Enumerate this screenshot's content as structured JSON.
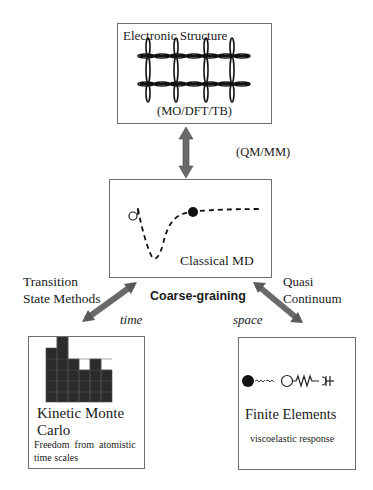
{
  "diagram": {
    "nodes": {
      "electronic_structure": {
        "title": "Electronic Structure",
        "subtitle": "(MO/DFT/TB)"
      },
      "classical_md": {
        "title": "Classical MD"
      },
      "kinetic_monte_carlo": {
        "title_line1": "Kinetic Monte",
        "title_line2": "Carlo",
        "note_line1": "Freedom  from  atomistic",
        "note_line2": "time scales"
      },
      "finite_elements": {
        "title": "Finite Elements",
        "note": "viscoelastic response"
      }
    },
    "edges": {
      "es_to_md": {
        "label": "(QM/MM)"
      },
      "md_to_kmc": {
        "label_line1": "Transition",
        "label_line2": "State Methods",
        "axis": "time"
      },
      "md_to_fe": {
        "label_line1": "Quasi",
        "label_line2": "Continuum",
        "axis": "space"
      }
    },
    "center_label": "Coarse-graining",
    "colors": {
      "box_border": "#6e6e6e",
      "arrow_fill": "#6a6a6a",
      "ink": "#1a1a1a"
    }
  }
}
